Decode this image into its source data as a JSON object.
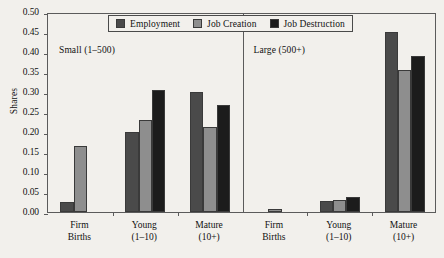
{
  "chart_data": {
    "type": "bar",
    "title": "",
    "subtitle": "",
    "xlabel": "",
    "ylabel": "Shares",
    "ylim": [
      0.0,
      0.5
    ],
    "ytick_labels": [
      "0.50",
      "0.45",
      "0.40",
      "0.35",
      "0.30",
      "0.25",
      "0.20",
      "0.15",
      "0.10",
      "0.05",
      "0.00"
    ],
    "ytick_values": [
      0.5,
      0.45,
      0.4,
      0.35,
      0.3,
      0.25,
      0.2,
      0.15,
      0.1,
      0.05,
      0.0
    ],
    "grid": false,
    "legend_position": "top-center",
    "legend": [
      "Employment",
      "Job Creation",
      "Job Destruction"
    ],
    "series_colors": [
      "#4a4a4a",
      "#8e8e8e",
      "#1c1c1c"
    ],
    "panels": [
      {
        "name": "Small (1–500)",
        "categories": [
          "Firm Births",
          "Young (1–10)",
          "Mature (10+)"
        ],
        "category_lines": [
          [
            "Firm",
            "Births"
          ],
          [
            "Young",
            "(1–10)"
          ],
          [
            "Mature",
            "(10+)"
          ]
        ],
        "series": [
          {
            "name": "Employment",
            "values": [
              0.025,
              0.2,
              0.3
            ]
          },
          {
            "name": "Job Creation",
            "values": [
              0.165,
              0.23,
              0.213
            ]
          },
          {
            "name": "Job Destruction",
            "values": [
              0.0,
              0.305,
              0.267
            ]
          }
        ]
      },
      {
        "name": "Large (500+)",
        "categories": [
          "Firm Births",
          "Young (1–10)",
          "Mature (10+)"
        ],
        "category_lines": [
          [
            "Firm",
            "Births"
          ],
          [
            "Young",
            "(1–10)"
          ],
          [
            "Mature",
            "(10+)"
          ]
        ],
        "series": [
          {
            "name": "Employment",
            "values": [
              0.0,
              0.027,
              0.45
            ]
          },
          {
            "name": "Job Creation",
            "values": [
              0.008,
              0.031,
              0.355
            ]
          },
          {
            "name": "Job Destruction",
            "values": [
              0.0,
              0.038,
              0.39
            ]
          }
        ]
      }
    ]
  }
}
